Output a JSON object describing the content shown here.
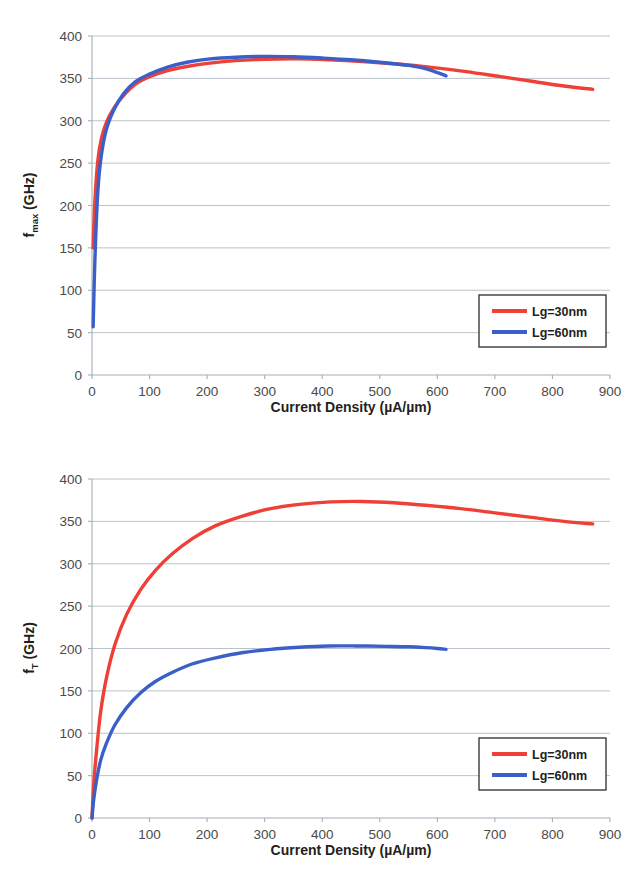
{
  "figure": {
    "background": "#ffffff",
    "series_colors": {
      "Lg=30nm": "#ee4036",
      "Lg=60nm": "#3a5fc8"
    },
    "gridline_color": "#9aa7b4",
    "axis_color": "#a6aeb6",
    "legend_border_color": "#3b3b3b"
  },
  "chart_data": [
    {
      "type": "line",
      "id": "fmax-vs-current-density",
      "title": "",
      "xlabel": "Current Density (µA/µm)",
      "ylabel": "f_max (GHz)",
      "ylabel_base": "f",
      "ylabel_sub": "max",
      "ylabel_unit": " (GHz)",
      "xlim": [
        0,
        900
      ],
      "ylim": [
        0,
        400
      ],
      "xticks": [
        0,
        100,
        200,
        300,
        400,
        500,
        600,
        700,
        800,
        900
      ],
      "yticks": [
        0,
        50,
        100,
        150,
        200,
        250,
        300,
        350,
        400
      ],
      "grid": true,
      "grid_axis": "y",
      "legend_position": "lower-right",
      "series": [
        {
          "name": "Lg=30nm",
          "color": "#ee4036",
          "x": [
            2,
            5,
            10,
            16,
            25,
            38,
            55,
            75,
            100,
            130,
            165,
            205,
            250,
            300,
            355,
            410,
            470,
            530,
            590,
            650,
            710,
            770,
            820,
            870
          ],
          "y": [
            150,
            205,
            252,
            278,
            298,
            315,
            330,
            343,
            352,
            359,
            364,
            368,
            371,
            372.5,
            373,
            372,
            370,
            367,
            363,
            358,
            352,
            346,
            341,
            337
          ]
        },
        {
          "name": "Lg=60nm",
          "color": "#3a5fc8",
          "x": [
            2,
            5,
            10,
            16,
            25,
            38,
            55,
            75,
            100,
            130,
            165,
            205,
            250,
            300,
            350,
            400,
            450,
            500,
            540,
            570,
            595,
            615
          ],
          "y": [
            57,
            135,
            215,
            258,
            290,
            313,
            332,
            346,
            355,
            363,
            369,
            373,
            375,
            376,
            375.5,
            374,
            372,
            369,
            366,
            363,
            358,
            353
          ]
        }
      ]
    },
    {
      "type": "line",
      "id": "ft-vs-current-density",
      "title": "",
      "xlabel": "Current Density (µA/µm)",
      "ylabel": "f_T (GHz)",
      "ylabel_base": "f",
      "ylabel_sub": "T",
      "ylabel_unit": " (GHz)",
      "xlim": [
        0,
        900
      ],
      "ylim": [
        0,
        400
      ],
      "xticks": [
        0,
        100,
        200,
        300,
        400,
        500,
        600,
        700,
        800,
        900
      ],
      "yticks": [
        0,
        50,
        100,
        150,
        200,
        250,
        300,
        350,
        400
      ],
      "grid": true,
      "grid_axis": "y",
      "legend_position": "lower-right",
      "series": [
        {
          "name": "Lg=30nm",
          "color": "#ee4036",
          "x": [
            0,
            3,
            8,
            15,
            25,
            40,
            60,
            85,
            110,
            140,
            175,
            215,
            260,
            310,
            360,
            415,
            470,
            525,
            580,
            640,
            700,
            760,
            820,
            870
          ],
          "y": [
            0,
            40,
            80,
            125,
            165,
            205,
            240,
            270,
            292,
            312,
            330,
            345,
            356,
            365,
            370,
            373,
            373.5,
            372,
            369,
            365,
            360,
            355,
            350,
            347
          ]
        },
        {
          "name": "Lg=60nm",
          "color": "#3a5fc8",
          "x": [
            0,
            3,
            8,
            15,
            25,
            40,
            60,
            85,
            110,
            140,
            175,
            215,
            260,
            310,
            360,
            410,
            460,
            510,
            550,
            580,
            600,
            615
          ],
          "y": [
            0,
            22,
            45,
            68,
            88,
            110,
            130,
            148,
            161,
            172,
            182,
            189,
            195,
            199,
            201.5,
            203,
            203,
            202.5,
            202,
            201,
            200,
            199
          ]
        }
      ]
    }
  ]
}
